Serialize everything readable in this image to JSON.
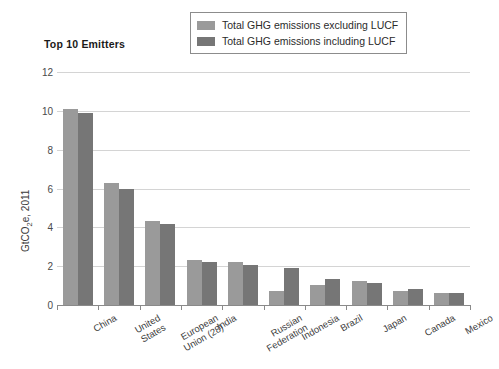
{
  "chart_data": {
    "type": "bar",
    "title": "Top 10 Emitters",
    "xlabel": "",
    "ylabel": "GtCO2e, 2011",
    "ylim": [
      0,
      12
    ],
    "yticks": [
      0,
      2,
      4,
      6,
      8,
      10,
      12
    ],
    "grid": true,
    "legend_position": "top-center",
    "categories": [
      "China",
      "United States",
      "European Union (28)",
      "India",
      "Russian Federation",
      "Indonesia",
      "Brazil",
      "Japan",
      "Canada",
      "Mexico"
    ],
    "category_lines": [
      [
        "China"
      ],
      [
        "United",
        "States"
      ],
      [
        "European",
        "Union (28)"
      ],
      [
        "India"
      ],
      [
        "Russian",
        "Federation"
      ],
      [
        "Indonesia"
      ],
      [
        "Brazil"
      ],
      [
        "Japan"
      ],
      [
        "Canada"
      ],
      [
        "Mexico"
      ]
    ],
    "series": [
      {
        "name": "Total GHG emissions excluding LUCF",
        "color": "#9a9a9a",
        "values": [
          10.1,
          6.3,
          4.35,
          2.3,
          2.2,
          0.7,
          1.05,
          1.25,
          0.7,
          0.6
        ]
      },
      {
        "name": "Total GHG emissions including LUCF",
        "color": "#767676",
        "values": [
          9.9,
          6.0,
          4.15,
          2.2,
          2.05,
          1.9,
          1.35,
          1.15,
          0.85,
          0.6
        ]
      }
    ]
  },
  "legend": {
    "items": [
      {
        "label": "Total GHG emissions excluding LUCF",
        "color": "#9a9a9a"
      },
      {
        "label": "Total GHG emissions including LUCF",
        "color": "#767676"
      }
    ]
  },
  "axis": {
    "y_title_prefix": "GtCO",
    "y_title_sub": "2",
    "y_title_suffix": "e, 2011"
  }
}
